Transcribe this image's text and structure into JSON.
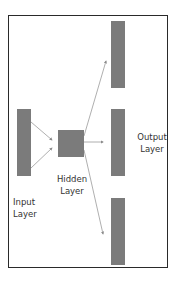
{
  "diagram": {
    "type": "neural-network-layers",
    "colors": {
      "node": "#7b7b7b",
      "edge": "#9a9a9a",
      "frame": "#2a2a2a",
      "text": "#333333",
      "background": "#ffffff"
    },
    "layers": [
      {
        "id": "input",
        "label_line1": "Input",
        "label_line2": "Layer",
        "nodes": 1
      },
      {
        "id": "hidden",
        "label_line1": "Hidden",
        "label_line2": "Layer",
        "nodes": 1
      },
      {
        "id": "output",
        "label_line1": "Output",
        "label_line2": "Layer",
        "nodes": 3
      }
    ],
    "edges": [
      {
        "from": "input",
        "to": "hidden"
      },
      {
        "from": "input",
        "to": "hidden"
      },
      {
        "from": "hidden",
        "to": "output-1"
      },
      {
        "from": "hidden",
        "to": "output-2"
      },
      {
        "from": "hidden",
        "to": "output-3"
      }
    ]
  }
}
